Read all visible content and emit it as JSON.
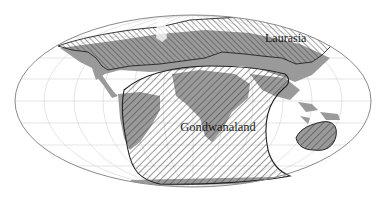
{
  "map": {
    "projection": "oval world projection",
    "labels": {
      "laurasia": "Laurasia",
      "gondwanaland": "Gondwanaland"
    },
    "regions": [
      {
        "name": "Laurasia",
        "fill": "hatched diagonal",
        "position": "northern band"
      },
      {
        "name": "Gondwanaland",
        "fill": "hatched diagonal",
        "position": "southern / central"
      }
    ],
    "colors": {
      "background": "#ffffff",
      "land": "#9a9a9a",
      "graticule": "#d4d4d4",
      "outline": "#8a8a8a",
      "boundary": "#222222",
      "hatch": "#3a3a3a"
    }
  }
}
